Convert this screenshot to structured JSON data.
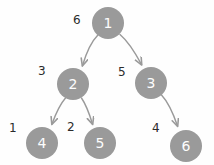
{
  "diagram": {
    "node_fill": "#9a9a9a",
    "node_text_color": "#fdfdfd",
    "edge_color": "#9a9a9a",
    "label_color": "#2b2b2b",
    "background": "#fefefe",
    "nodes": [
      {
        "id": "n1",
        "label": "1",
        "cx": 108,
        "cy": 23,
        "r": 16
      },
      {
        "id": "n2",
        "label": "2",
        "cx": 73,
        "cy": 84,
        "r": 16
      },
      {
        "id": "n3",
        "label": "3",
        "cx": 151,
        "cy": 83,
        "r": 16
      },
      {
        "id": "n4",
        "label": "4",
        "cx": 42,
        "cy": 143,
        "r": 16
      },
      {
        "id": "n5",
        "label": "5",
        "cx": 100,
        "cy": 143,
        "r": 16
      },
      {
        "id": "n6",
        "label": "6",
        "cx": 186,
        "cy": 146,
        "r": 16
      }
    ],
    "edges": [
      {
        "id": "e1",
        "from": "n1",
        "to": "n2",
        "weight": "6",
        "label_x": 73,
        "label_y": 14
      },
      {
        "id": "e2",
        "from": "n1",
        "to": "n3",
        "weight": "5",
        "label_x": 118,
        "label_y": 66
      },
      {
        "id": "e3",
        "from": "n2",
        "to": "n4",
        "weight": "3",
        "label_x": 38,
        "label_y": 65
      },
      {
        "id": "e4",
        "from": "n2",
        "to": "n5",
        "weight": "2",
        "label_x": 67,
        "label_y": 121
      },
      {
        "id": "e5",
        "from": "n4",
        "to": "n4",
        "weight": "1",
        "label_x": 9,
        "label_y": 122
      },
      {
        "id": "e6",
        "from": "n3",
        "to": "n6",
        "weight": "4",
        "label_x": 152,
        "label_y": 122
      }
    ]
  }
}
